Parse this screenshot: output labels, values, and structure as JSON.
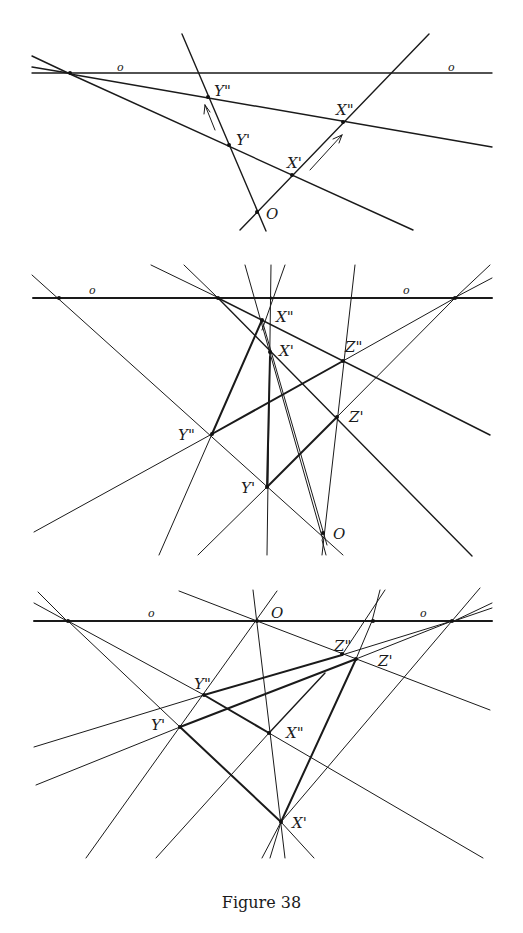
{
  "figure": {
    "caption": "Figure 38",
    "panels": [
      {
        "id": "panel-1",
        "labels": {
          "o_left": "o",
          "o_right": "o",
          "y2": "Y\"",
          "y1": "Y'",
          "x2": "X\"",
          "x1": "X'",
          "origin": "O"
        }
      },
      {
        "id": "panel-2",
        "labels": {
          "o_left": "o",
          "o_right": "o",
          "x2": "X\"",
          "x1": "X'",
          "z2": "Z\"",
          "z1": "Z'",
          "y2": "Y\"",
          "y1": "Y'",
          "origin": "O"
        }
      },
      {
        "id": "panel-3",
        "labels": {
          "o_left": "o",
          "o_right": "o",
          "origin": "O",
          "z2": "Z\"",
          "z1": "Z'",
          "y2": "Y\"",
          "y1": "Y'",
          "x2": "X\"",
          "x1": "X'"
        }
      }
    ]
  }
}
